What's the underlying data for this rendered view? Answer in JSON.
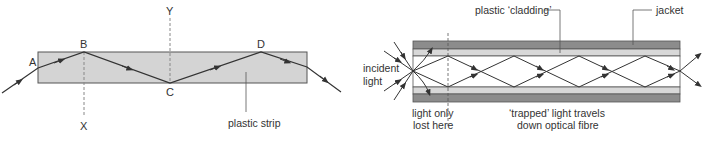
{
  "left_diagram": {
    "labels": {
      "A": "A",
      "B": "B",
      "C": "C",
      "D": "D",
      "X": "X",
      "Y": "Y",
      "strip": "plastic strip"
    },
    "colors": {
      "strip_fill": "#d4d4d4",
      "strip_stroke": "#555555",
      "ray": "#333333",
      "normal": "#888888"
    }
  },
  "right_diagram": {
    "labels": {
      "cladding": "plastic ‘cladding’",
      "jacket": "jacket",
      "incident_line1": "incident",
      "incident_line2": "light",
      "lost_line1": "light only",
      "lost_line2": "lost here",
      "trapped_line1": "‘trapped’ light travels",
      "trapped_line2": "down optical fibre"
    },
    "colors": {
      "jacket": "#8c8c8c",
      "cladding": "#d8d8d8",
      "core": "#ffffff",
      "ray": "#333333"
    }
  }
}
